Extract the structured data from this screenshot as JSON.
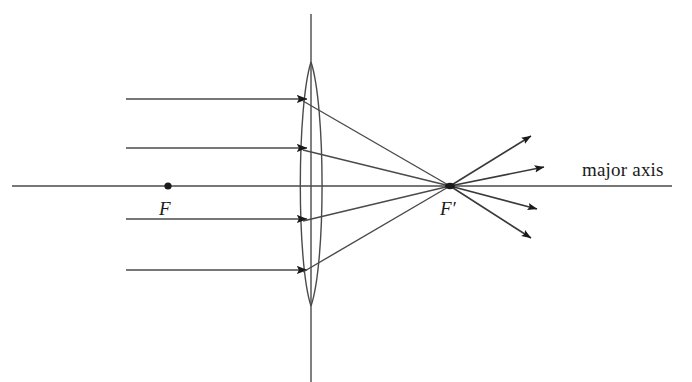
{
  "diagram": {
    "background_color": "#ffffff",
    "stroke_color": "#3a3a3a",
    "dark_stroke_color": "#1a1a1a",
    "labels": {
      "focal_point_left": "F",
      "focal_point_right": "F′",
      "axis_label": "major axis"
    },
    "optical_axis": {
      "name": "major-axis",
      "x1": 12,
      "y1": 186,
      "x2": 672,
      "y2": 186
    },
    "lens_plane": {
      "name": "lens-plane-vertical-line",
      "x1": 311,
      "y1": 14,
      "x2": 311,
      "y2": 382
    },
    "lens": {
      "name": "biconvex-lens",
      "center_x": 311,
      "top_y": 62,
      "bottom_y": 306,
      "half_width": 14.5
    },
    "focal_point_left_marker": {
      "name": "focal-point-F-dot",
      "cx": 168,
      "cy": 186,
      "r": 3.6
    },
    "focal_point_right_marker": {
      "name": "focal-point-F-prime-dot",
      "cx": 450,
      "cy": 186,
      "rx": 5.0,
      "ry": 3.2
    },
    "incident_rays": [
      {
        "name": "incident-ray-1",
        "x1": 126,
        "y1": 99,
        "x2": 311,
        "y2": 99,
        "arrow_x": 304,
        "arrow_y": 99
      },
      {
        "name": "incident-ray-2",
        "x1": 126,
        "y1": 148,
        "x2": 311,
        "y2": 148,
        "arrow_x": 304,
        "arrow_y": 148
      },
      {
        "name": "incident-ray-3",
        "x1": 126,
        "y1": 219,
        "x2": 311,
        "y2": 219,
        "arrow_x": 304,
        "arrow_y": 219
      },
      {
        "name": "incident-ray-4",
        "x1": 126,
        "y1": 270,
        "x2": 311,
        "y2": 270,
        "arrow_x": 304,
        "arrow_y": 270
      }
    ],
    "refracted_rays": [
      {
        "name": "refracted-ray-1",
        "x1": 305,
        "y1": 101,
        "x2": 450,
        "y2": 186
      },
      {
        "name": "refracted-ray-2",
        "x1": 305,
        "y1": 150,
        "x2": 450,
        "y2": 186
      },
      {
        "name": "refracted-ray-3",
        "x1": 305,
        "y1": 221,
        "x2": 450,
        "y2": 186
      },
      {
        "name": "refracted-ray-4",
        "x1": 305,
        "y1": 272,
        "x2": 450,
        "y2": 186
      }
    ],
    "diverging_rays": [
      {
        "name": "diverging-ray-1",
        "x1": 450,
        "y1": 186,
        "x2": 532,
        "y2": 135
      },
      {
        "name": "diverging-ray-2",
        "x1": 450,
        "y1": 186,
        "x2": 545,
        "y2": 166
      },
      {
        "name": "diverging-ray-3",
        "x1": 450,
        "y1": 186,
        "x2": 538,
        "y2": 210
      },
      {
        "name": "diverging-ray-4",
        "x1": 450,
        "y1": 186,
        "x2": 532,
        "y2": 239
      }
    ]
  }
}
